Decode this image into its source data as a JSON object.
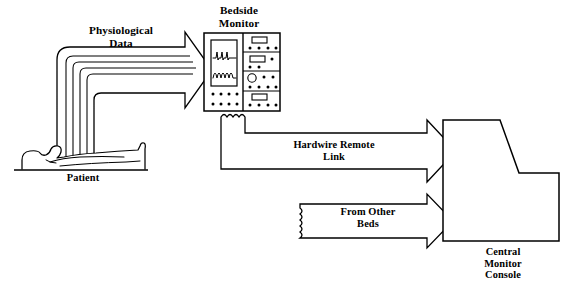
{
  "diagram": {
    "type": "block-flow-diagram",
    "background_color": "#ffffff",
    "stroke_color": "#000000",
    "labels": {
      "physiological_data": "Physiological\nData",
      "bedside_monitor": "Bedside\nMonitor",
      "patient": "Patient",
      "hardwire_remote_link": "Hardwire Remote\nLink",
      "from_other_beds": "From Other\nBeds",
      "central_monitor_console": "Central\nMonitor\nConsole"
    },
    "nodes": [
      {
        "id": "patient",
        "name": "patient-figure",
        "label": "Patient",
        "description": "Reclining human figure lying on a horizontal bed line"
      },
      {
        "id": "bedside-monitor",
        "name": "bedside-monitor",
        "label": "Bedside Monitor",
        "description": "Instrument cabinet with waveform display screen on the left and four control modules on the right",
        "screen_waveforms": [
          "ecg-qrs-spikes",
          "pulse-sine-waves"
        ],
        "control_modules": 4
      },
      {
        "id": "central-console",
        "name": "central-monitor-console",
        "label": "Central Monitor Console",
        "description": "Stepped console cabinet, tall left section with sloped shoulder down to a lower right section"
      }
    ],
    "connections": [
      {
        "id": "physiological-data-arrow",
        "label": "Physiological Data",
        "from": "patient",
        "to": "bedside-monitor",
        "style": "wide-hollow-elbow-arrow",
        "internal_lines": 4
      },
      {
        "id": "hardwire-remote-link-arrow",
        "label": "Hardwire Remote Link",
        "from": "bedside-monitor",
        "to": "central-console",
        "style": "hollow-arrow-with-scalloped-cable-tail"
      },
      {
        "id": "from-other-beds-arrow",
        "label": "From Other Beds",
        "from": "other-beds",
        "to": "central-console",
        "style": "hollow-arrow-with-torn-edge-tail"
      }
    ]
  }
}
